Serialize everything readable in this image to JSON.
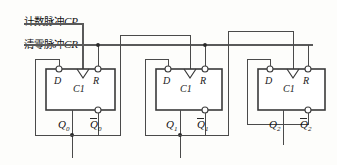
{
  "diagram": {
    "type": "schematic",
    "background": "#fdfdfb",
    "wire_color": "#4a4a4a",
    "box_color": "#3a3a3a"
  },
  "inputs": [
    {
      "id": "cp",
      "cn": "计数脉冲",
      "latin": "CP",
      "meaning": "count pulse",
      "role": "clock input to first stage"
    },
    {
      "id": "cr",
      "cn": "清零脉冲",
      "latin": "CR",
      "meaning": "clear pulse",
      "role": "reset bus to all R inputs"
    }
  ],
  "stages": [
    {
      "index": 0,
      "pins": {
        "d": "D",
        "clk": "C1",
        "r": "R"
      },
      "outputs": {
        "q": "Q",
        "qbar": "Q",
        "subscript": "0"
      }
    },
    {
      "index": 1,
      "pins": {
        "d": "D",
        "clk": "C1",
        "r": "R"
      },
      "outputs": {
        "q": "Q",
        "qbar": "Q",
        "subscript": "1"
      }
    },
    {
      "index": 2,
      "pins": {
        "d": "D",
        "clk": "C1",
        "r": "R"
      },
      "outputs": {
        "q": "Q",
        "qbar": "Q",
        "subscript": "2"
      }
    }
  ],
  "nets": {
    "clock_chain": "CP -> FF0.C1 ; FF0.Qbar -> FF1.C1 ; FF1.Qbar -> FF2.C1",
    "feedback": "each Qbar returns to its own D input",
    "reset": "CR bus fans out to R of FF0, FF1, FF2"
  }
}
